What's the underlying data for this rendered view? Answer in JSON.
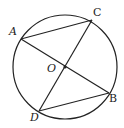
{
  "diagram": {
    "type": "geometry-circle",
    "circle": {
      "cx": 65,
      "cy": 67,
      "r": 52,
      "stroke": "#222222"
    },
    "points": {
      "A": {
        "x": 21,
        "y": 39,
        "label": "A",
        "lx": 9,
        "ly": 26
      },
      "C": {
        "x": 92,
        "y": 20,
        "label": "C",
        "lx": 93,
        "ly": 7
      },
      "B": {
        "x": 109,
        "y": 93,
        "label": "B",
        "lx": 109,
        "ly": 93
      },
      "D": {
        "x": 39,
        "y": 111,
        "label": "D",
        "lx": 30,
        "ly": 112
      },
      "O": {
        "x": 65,
        "y": 67,
        "label": "O",
        "lx": 47,
        "ly": 63
      }
    },
    "segments": [
      [
        "A",
        "C"
      ],
      [
        "A",
        "B"
      ],
      [
        "C",
        "D"
      ],
      [
        "D",
        "B"
      ]
    ],
    "center_dot": {
      "r": 1.6,
      "fill": "#222222"
    }
  }
}
